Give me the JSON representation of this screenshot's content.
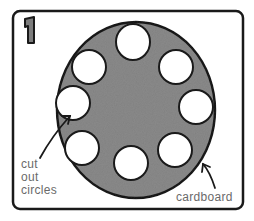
{
  "step_number": "1",
  "labels": {
    "holes": [
      "cut",
      "out",
      "circles"
    ],
    "disc": "cardboard"
  },
  "colors": {
    "disc_fill": "#8a8a8a",
    "outline": "#1a1a1a",
    "label_text": "#6a6a6a"
  },
  "disc": {
    "cx": 136,
    "cy": 110,
    "rx": 79,
    "ry": 88
  },
  "holes": [
    {
      "cx": 133,
      "cy": 42
    },
    {
      "cx": 176,
      "cy": 67
    },
    {
      "cx": 196,
      "cy": 107
    },
    {
      "cx": 175,
      "cy": 150
    },
    {
      "cx": 131,
      "cy": 163
    },
    {
      "cx": 82,
      "cy": 148
    },
    {
      "cx": 73,
      "cy": 103
    },
    {
      "cx": 89,
      "cy": 67
    }
  ]
}
